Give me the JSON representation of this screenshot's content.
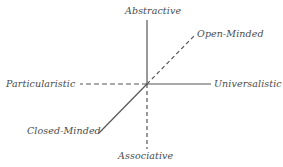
{
  "diagram": {
    "title": "",
    "colors": {
      "line": "#555555",
      "label": "#4a4a4a"
    },
    "axes": [
      {
        "name": "vertical",
        "positive_label": "Abstractive",
        "positive_style": "solid",
        "negative_label": "Associative",
        "negative_style": "dashed"
      },
      {
        "name": "horizontal",
        "positive_label": "Universalistic",
        "positive_style": "solid",
        "negative_label": "Particularistic",
        "negative_style": "dashed"
      },
      {
        "name": "diagonal",
        "positive_label": "Open-Minded",
        "positive_style": "dashed",
        "negative_label": "Closed-Minded",
        "negative_style": "solid"
      }
    ],
    "labels": {
      "top": "Abstractive",
      "bottom": "Associative",
      "left": "Particularistic",
      "right": "Universalistic",
      "upper_right": "Open-Minded",
      "lower_left": "Closed-Minded"
    }
  }
}
